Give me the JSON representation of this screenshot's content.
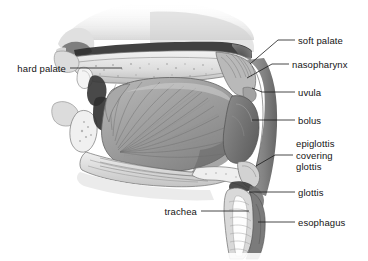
{
  "figure": {
    "width": 368,
    "height": 261,
    "background_color": "#ffffff",
    "line_color": "#1a1a1a",
    "text_color": "#141414"
  },
  "labels": [
    {
      "id": "soft-palate",
      "text": "soft palate",
      "side": "right",
      "text_x": 298,
      "text_y": 35,
      "leader": [
        [
          295,
          40
        ],
        [
          278,
          40
        ],
        [
          250,
          64
        ]
      ]
    },
    {
      "id": "nasopharynx",
      "text": "nasopharynx",
      "side": "right",
      "text_x": 292,
      "text_y": 59,
      "leader": [
        [
          289,
          64
        ],
        [
          272,
          64
        ],
        [
          247,
          78
        ]
      ]
    },
    {
      "id": "uvula",
      "text": "uvula",
      "side": "right",
      "text_x": 298,
      "text_y": 87,
      "leader": [
        [
          295,
          92
        ],
        [
          262,
          92
        ],
        [
          252,
          88
        ]
      ]
    },
    {
      "id": "bolus",
      "text": "bolus",
      "side": "right",
      "text_x": 298,
      "text_y": 115,
      "leader": [
        [
          295,
          120
        ],
        [
          252,
          120
        ]
      ]
    },
    {
      "id": "epiglottis-covering-glottis",
      "text": "epiglottis\ncovering\nglottis",
      "side": "right",
      "text_x": 296,
      "text_y": 138,
      "leader": [
        [
          293,
          155
        ],
        [
          275,
          155
        ],
        [
          256,
          166
        ]
      ]
    },
    {
      "id": "glottis",
      "text": "glottis",
      "side": "right",
      "text_x": 298,
      "text_y": 187,
      "leader": [
        [
          295,
          192
        ],
        [
          249,
          192
        ]
      ]
    },
    {
      "id": "esophagus",
      "text": "esophagus",
      "side": "right",
      "text_x": 298,
      "text_y": 217,
      "leader": [
        [
          295,
          222
        ],
        [
          258,
          222
        ]
      ]
    },
    {
      "id": "hard-palate",
      "text": "hard palate",
      "side": "left",
      "text_x": 12,
      "text_y": 63,
      "leader": [
        [
          70,
          68
        ],
        [
          122,
          68
        ]
      ]
    },
    {
      "id": "trachea",
      "text": "trachea",
      "side": "left",
      "text_x": 162,
      "text_y": 206,
      "leader": [
        [
          201,
          211
        ],
        [
          249,
          211
        ]
      ]
    }
  ],
  "structures": [
    {
      "id": "nasal-cavity",
      "label": "nasal cavity"
    },
    {
      "id": "nose-profile",
      "label": "external nose and upper face"
    },
    {
      "id": "hard-palate-bone",
      "label": "hard palate bone"
    },
    {
      "id": "soft-palate-body",
      "label": "soft palate elevated against nasopharynx"
    },
    {
      "id": "uvula-tip",
      "label": "uvula"
    },
    {
      "id": "upper-lip",
      "label": "upper lip"
    },
    {
      "id": "lower-lip",
      "label": "lower lip"
    },
    {
      "id": "upper-teeth",
      "label": "upper incisor"
    },
    {
      "id": "lower-teeth",
      "label": "lower incisor"
    },
    {
      "id": "tongue",
      "label": "tongue with radiating intrinsic muscle fibers"
    },
    {
      "id": "oral-cavity",
      "label": "oral cavity"
    },
    {
      "id": "bolus-mass",
      "label": "food bolus in oropharynx"
    },
    {
      "id": "pharynx-wall",
      "label": "posterior pharyngeal wall"
    },
    {
      "id": "epiglottis-flap",
      "label": "epiglottis folded over laryngeal inlet"
    },
    {
      "id": "hyoid-larynx",
      "label": "hyoid bone and laryngeal cartilage"
    },
    {
      "id": "trachea-tube",
      "label": "trachea with open lumen"
    },
    {
      "id": "esophagus-tube",
      "label": "esophagus"
    },
    {
      "id": "mandible",
      "label": "mandible and floor of mouth"
    }
  ]
}
